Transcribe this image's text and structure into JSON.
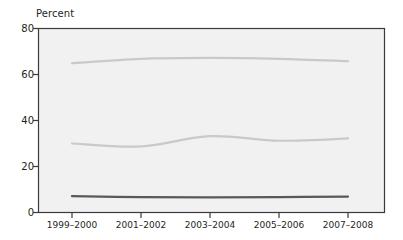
{
  "chart_data": {
    "type": "line",
    "title": "",
    "subtitle": "",
    "xlabel": "",
    "ylabel": "Percent",
    "ylim": [
      0,
      80
    ],
    "yticks": [
      0,
      20,
      40,
      60,
      80
    ],
    "grid": false,
    "legend_position": "inline-labels",
    "background": "#f1f1f1",
    "categories": [
      "1999–2000",
      "2001–2002",
      "2003–2004",
      "2005–2006",
      "2007–2008"
    ],
    "series": [
      {
        "name": "60 years and older",
        "color": "#c9c9c9",
        "values": [
          64.9,
          66.8,
          67.2,
          66.8,
          65.8
        ],
        "label_text": "60 years and older"
      },
      {
        "name": "40–59 years",
        "color": "#c9c9c9",
        "values": [
          30.0,
          28.7,
          33.2,
          31.2,
          32.2
        ],
        "label_text": "40–59 years"
      },
      {
        "name": "18–39 years",
        "color": "#595959",
        "values": [
          7.1,
          6.7,
          6.6,
          6.7,
          6.9
        ],
        "label_text": "18–39 years"
      }
    ]
  },
  "axis": {
    "y_title": "Percent",
    "y_tick_labels": [
      "80",
      "60",
      "40",
      "20",
      "0"
    ],
    "x_tick_labels": [
      "1999–2000",
      "2001–2002",
      "2003–2004",
      "2005–2006",
      "2007–2008"
    ]
  },
  "series_labels": {
    "top": "60 years and older",
    "middle": "40–59 years",
    "bottom": "18–39 years"
  },
  "colors": {
    "plot_background": "#f1f1f1",
    "plot_border": "#3a3a3a",
    "text": "#231f20",
    "light_series": "#c9c9c9",
    "dark_series": "#595959"
  }
}
